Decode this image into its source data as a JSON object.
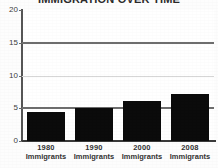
{
  "chart_data": {
    "type": "bar",
    "title": "IMMIGRATION OVER TIME",
    "xlabel": "",
    "ylabel": "",
    "categories": [
      "1980",
      "1990",
      "2000",
      "2008"
    ],
    "category_sublabels": [
      "Immigrants",
      "Immigrants",
      "Immigrants",
      "Immigrants"
    ],
    "values": [
      4.4,
      5.0,
      6.1,
      7.1
    ],
    "ylim": [
      0,
      20
    ],
    "yticks": [
      0,
      5,
      10,
      15,
      20
    ],
    "ytick_labels": [
      "0",
      "5",
      "10",
      "15",
      "20"
    ],
    "gridlines": [
      {
        "value": 5,
        "weight": "heavy"
      },
      {
        "value": 10,
        "weight": "light"
      },
      {
        "value": 15,
        "weight": "heavy"
      }
    ],
    "grid": true,
    "legend": "none",
    "bar_color": "#0b0b0b",
    "background_color": "#ffffff",
    "axis_color": "#3a3a3a"
  }
}
